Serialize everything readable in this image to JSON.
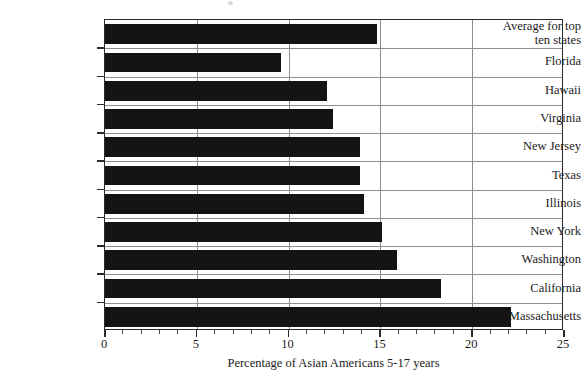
{
  "chart_data": {
    "type": "bar",
    "orientation": "horizontal",
    "title": "",
    "xlabel": "Percentage of Asian Americans 5-17 years",
    "ylabel": "",
    "xlim": [
      0,
      25
    ],
    "xticks": [
      0,
      5,
      10,
      15,
      20,
      25
    ],
    "xticklabels": [
      "0",
      "5",
      "10",
      "15",
      "20",
      "25"
    ],
    "minor_tick_interval": 1,
    "grid": "vertical-major-and-horizontal-category",
    "legend": "none",
    "bar_color": "#141414",
    "categories": [
      "Average for top ten states",
      "Florida",
      "Hawaii",
      "Virginia",
      "New Jersey",
      "Texas",
      "Illinois",
      "New York",
      "Washington",
      "California",
      "Massachusetts"
    ],
    "category_labels_display": [
      "Average for top\nten states",
      "Florida",
      "Hawaii",
      "Virginia",
      "New Jersey",
      "Texas",
      "Illinois",
      "New York",
      "Washington",
      "California",
      "Massachusetts"
    ],
    "values": [
      14.8,
      9.6,
      12.1,
      12.4,
      13.9,
      13.9,
      14.1,
      15.1,
      15.9,
      18.3,
      22.1
    ]
  }
}
